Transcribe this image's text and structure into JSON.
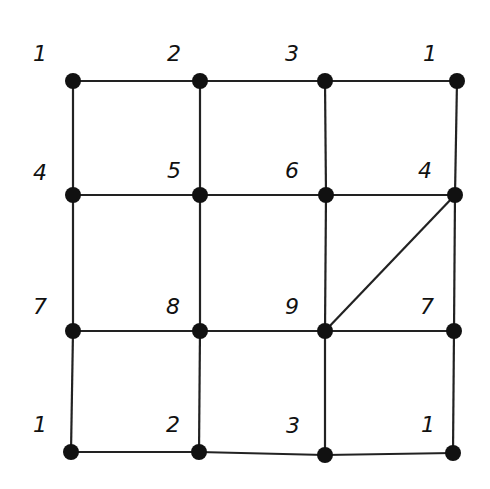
{
  "diagram": {
    "type": "grid-graph",
    "nodes": [
      {
        "id": "n00",
        "label": "1",
        "x": 73,
        "y": 81,
        "lx": 40,
        "ly": 54
      },
      {
        "id": "n01",
        "label": "2",
        "x": 200,
        "y": 81,
        "lx": 174,
        "ly": 54
      },
      {
        "id": "n02",
        "label": "3",
        "x": 325,
        "y": 81,
        "lx": 292,
        "ly": 54
      },
      {
        "id": "n03",
        "label": "1",
        "x": 457,
        "y": 81,
        "lx": 430,
        "ly": 54
      },
      {
        "id": "n10",
        "label": "4",
        "x": 73,
        "y": 195,
        "lx": 40,
        "ly": 173
      },
      {
        "id": "n11",
        "label": "5",
        "x": 200,
        "y": 195,
        "lx": 174,
        "ly": 171
      },
      {
        "id": "n12",
        "label": "6",
        "x": 326,
        "y": 195,
        "lx": 292,
        "ly": 171
      },
      {
        "id": "n13",
        "label": "4",
        "x": 455,
        "y": 195,
        "lx": 425,
        "ly": 171
      },
      {
        "id": "n20",
        "label": "7",
        "x": 73,
        "y": 331,
        "lx": 40,
        "ly": 307
      },
      {
        "id": "n21",
        "label": "8",
        "x": 200,
        "y": 331,
        "lx": 173,
        "ly": 307
      },
      {
        "id": "n22",
        "label": "9",
        "x": 325,
        "y": 331,
        "lx": 292,
        "ly": 307
      },
      {
        "id": "n23",
        "label": "7",
        "x": 454,
        "y": 331,
        "lx": 427,
        "ly": 307
      },
      {
        "id": "n30",
        "label": "1",
        "x": 71,
        "y": 452,
        "lx": 40,
        "ly": 425
      },
      {
        "id": "n31",
        "label": "2",
        "x": 199,
        "y": 452,
        "lx": 173,
        "ly": 425
      },
      {
        "id": "n32",
        "label": "3",
        "x": 325,
        "y": 455,
        "lx": 293,
        "ly": 426
      },
      {
        "id": "n33",
        "label": "1",
        "x": 453,
        "y": 453,
        "lx": 428,
        "ly": 425
      }
    ],
    "edges": [
      [
        "n00",
        "n01"
      ],
      [
        "n01",
        "n02"
      ],
      [
        "n02",
        "n03"
      ],
      [
        "n10",
        "n11"
      ],
      [
        "n11",
        "n12"
      ],
      [
        "n12",
        "n13"
      ],
      [
        "n20",
        "n21"
      ],
      [
        "n21",
        "n22"
      ],
      [
        "n22",
        "n23"
      ],
      [
        "n30",
        "n31"
      ],
      [
        "n31",
        "n32"
      ],
      [
        "n32",
        "n33"
      ],
      [
        "n00",
        "n10"
      ],
      [
        "n10",
        "n20"
      ],
      [
        "n20",
        "n30"
      ],
      [
        "n01",
        "n11"
      ],
      [
        "n11",
        "n21"
      ],
      [
        "n21",
        "n31"
      ],
      [
        "n02",
        "n12"
      ],
      [
        "n12",
        "n22"
      ],
      [
        "n22",
        "n32"
      ],
      [
        "n03",
        "n13"
      ],
      [
        "n13",
        "n23"
      ],
      [
        "n23",
        "n33"
      ],
      [
        "n22",
        "n13"
      ]
    ],
    "node_color": "#111111",
    "edge_color": "#222222"
  }
}
